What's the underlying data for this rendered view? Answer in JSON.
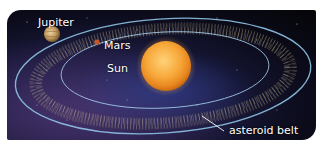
{
  "figure": {
    "labels": {
      "jupiter": "Jupiter",
      "mars": "Mars",
      "sun": "Sun",
      "asteroid_belt": "asteroid belt"
    },
    "colors": {
      "space": "#0b0b1a",
      "sun": "#f6a531",
      "jupiter": "#c9a36a",
      "mars": "#c4542a",
      "orbit": "#8fc3e6",
      "asteroids": "#c9b98a"
    }
  }
}
